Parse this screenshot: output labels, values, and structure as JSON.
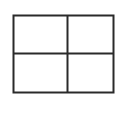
{
  "icon": {
    "name": "table-grid-icon",
    "rows": 2,
    "columns": 2,
    "stroke_color": "#2a2a2a",
    "background": "#ffffff"
  }
}
